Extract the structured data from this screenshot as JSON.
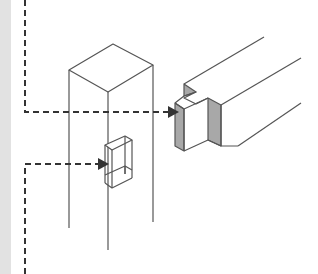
{
  "diagram": {
    "type": "isometric-joinery",
    "colors": {
      "background": "#ffffff",
      "side_strip": "#e2e2e2",
      "line": "#555555",
      "dashed_leader": "#333333",
      "shaded_face": "#a8a8a8"
    },
    "parts": [
      {
        "id": "post",
        "label": ""
      },
      {
        "id": "mortise",
        "label": ""
      },
      {
        "id": "beam-with-tenon",
        "label": ""
      }
    ],
    "leaders": [
      {
        "id": "leader-upper",
        "target": "beam-tenon"
      },
      {
        "id": "leader-lower",
        "target": "mortise"
      }
    ]
  }
}
